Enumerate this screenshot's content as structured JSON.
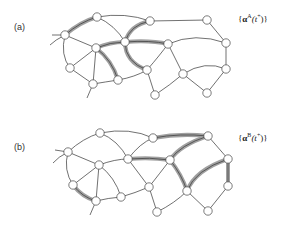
{
  "colors": {
    "edge": "#333333",
    "highlight": "#999999",
    "node_fill": "#ffffff",
    "node_stroke": "#444444"
  },
  "panels": [
    {
      "label": "(a)",
      "formula": {
        "open": "{",
        "symbol": "α",
        "superscript": "A",
        "arg": "(t",
        "arg_sup": "+",
        "close": ")}"
      },
      "highlighted_paths": [
        "D-A",
        "E-B",
        "F-E",
        "E-G",
        "F-J",
        "E-K"
      ]
    },
    {
      "label": "(b)",
      "formula": {
        "open": "{",
        "symbol": "α",
        "superscript": "B",
        "arg": "(t",
        "arg_sup": "+",
        "close": ")}"
      },
      "highlighted_paths": [
        "B-C",
        "G-C",
        "E-G",
        "G-L",
        "L-H",
        "H-M",
        "I-N"
      ]
    }
  ]
}
